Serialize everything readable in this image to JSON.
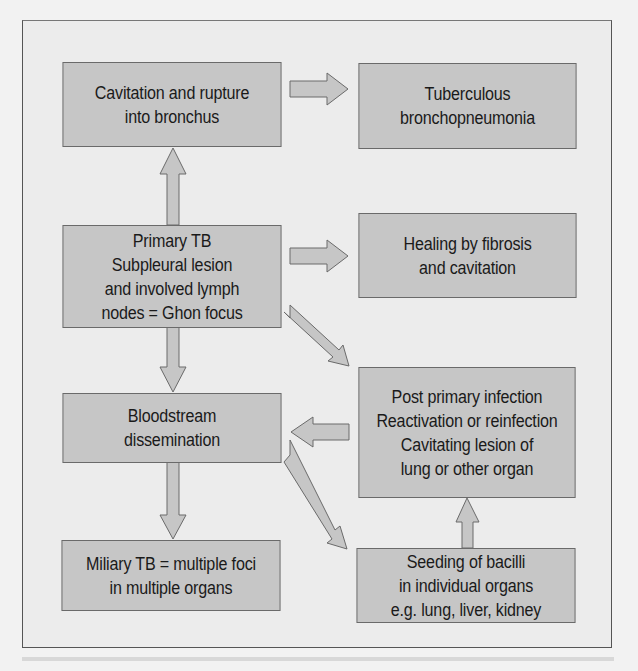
{
  "diagram": {
    "title": "",
    "colors": {
      "background": "#ececec",
      "box_fill": "#c6c6c6",
      "border": "#6a6a6a",
      "text": "#1a1a1a"
    },
    "nodes": {
      "cavitation": {
        "label": "Cavitation and rupture\ninto bronchus"
      },
      "bronchopneumonia": {
        "label": "Tuberculous\nbronchopneumonia"
      },
      "primary_tb": {
        "label": "Primary TB\nSubpleural lesion\nand involved lymph\nnodes = Ghon focus"
      },
      "healing": {
        "label": "Healing by fibrosis\nand cavitation"
      },
      "post_primary": {
        "label": "Post primary infection\nReactivation or reinfection\nCavitating lesion of\nlung or other organ"
      },
      "bloodstream": {
        "label": "Bloodstream\ndissemination"
      },
      "miliary": {
        "label": "Miliary TB = multiple foci\nin multiple organs"
      },
      "seeding": {
        "label": "Seeding of bacilli\nin individual organs\ne.g. lung, liver, kidney"
      }
    },
    "edges": [
      {
        "from": "primary_tb",
        "to": "cavitation"
      },
      {
        "from": "cavitation",
        "to": "bronchopneumonia"
      },
      {
        "from": "primary_tb",
        "to": "healing"
      },
      {
        "from": "primary_tb",
        "to": "bloodstream"
      },
      {
        "from": "primary_tb",
        "to": "post_primary"
      },
      {
        "from": "post_primary",
        "to": "bloodstream"
      },
      {
        "from": "bloodstream",
        "to": "miliary"
      },
      {
        "from": "bloodstream",
        "to": "seeding"
      },
      {
        "from": "seeding",
        "to": "post_primary"
      }
    ]
  }
}
